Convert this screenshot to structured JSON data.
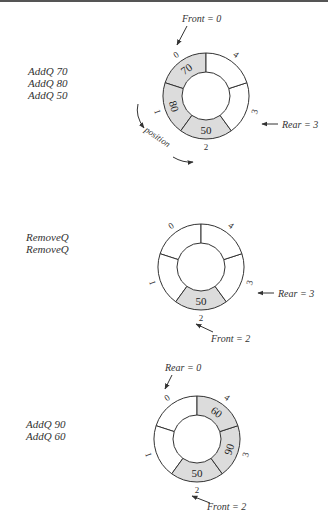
{
  "colors": {
    "filled": "#dcdcdc",
    "empty": "#ffffff",
    "stroke": "#333333"
  },
  "panels": [
    {
      "operations": [
        "AddQ 70",
        "AddQ 80",
        "AddQ 50"
      ],
      "slots": [
        {
          "index": "0",
          "value": "70"
        },
        {
          "index": "1",
          "value": "80"
        },
        {
          "index": "2",
          "value": "50"
        },
        {
          "index": "3",
          "value": ""
        },
        {
          "index": "4",
          "value": ""
        }
      ],
      "front_label": "Front = 0",
      "rear_label": "Rear = 3",
      "position_label": "position"
    },
    {
      "operations": [
        "RemoveQ",
        "RemoveQ"
      ],
      "slots": [
        {
          "index": "0",
          "value": ""
        },
        {
          "index": "1",
          "value": ""
        },
        {
          "index": "2",
          "value": "50"
        },
        {
          "index": "3",
          "value": ""
        },
        {
          "index": "4",
          "value": ""
        }
      ],
      "front_label": "Front = 2",
      "rear_label": "Rear = 3"
    },
    {
      "operations": [
        "AddQ 90",
        "AddQ 60"
      ],
      "slots": [
        {
          "index": "0",
          "value": ""
        },
        {
          "index": "1",
          "value": ""
        },
        {
          "index": "2",
          "value": "50"
        },
        {
          "index": "3",
          "value": "90"
        },
        {
          "index": "4",
          "value": "60"
        }
      ],
      "front_label": "Front = 2",
      "rear_label": "Rear = 0"
    }
  ]
}
